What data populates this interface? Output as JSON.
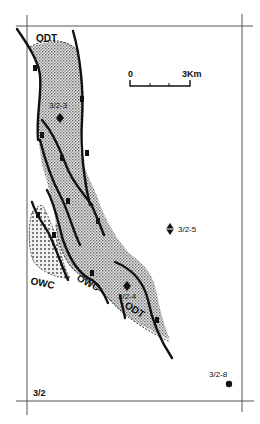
{
  "map": {
    "block_label": "3/2",
    "scale_bar": {
      "start_label": "0",
      "end_label": "3Km"
    },
    "contact_labels": {
      "odt_top": "ODT",
      "odt_bottom": "ODT",
      "owc_left": "OWC",
      "owc_middle": "OWC"
    },
    "wells": [
      {
        "id": "3/2-3",
        "symbol": "oil-well",
        "x": 60,
        "y": 118
      },
      {
        "id": "3/2-4",
        "symbol": "oil-well",
        "x": 127,
        "y": 286
      },
      {
        "id": "3/2-5",
        "symbol": "dry-well-with-shows",
        "x": 170,
        "y": 229
      },
      {
        "id": "3/2-8",
        "symbol": "well",
        "x": 229,
        "y": 384
      }
    ],
    "colors": {
      "ink": "#111111",
      "frame": "#555555",
      "fill_pattern": "#9a9a9a",
      "background": "#ffffff"
    }
  }
}
